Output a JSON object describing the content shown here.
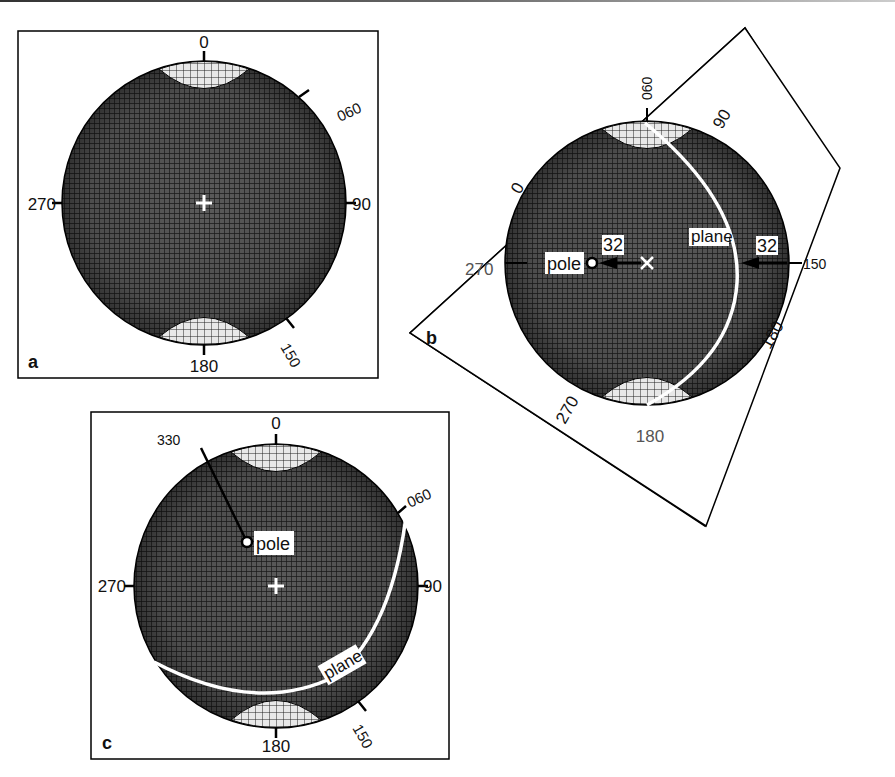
{
  "figure": {
    "panels": [
      {
        "id": "a",
        "panel_label": "a",
        "labels": {
          "n": "0",
          "e": "90",
          "s": "180",
          "w": "270",
          "ne": "060",
          "se": "150"
        }
      },
      {
        "id": "b",
        "panel_label": "b",
        "rotation_deg": -30,
        "labels": {
          "top": "060",
          "upper_right": "90",
          "left_upper": "0",
          "right_lower": "180",
          "lower_left": "270",
          "bottom": "180",
          "left": "270",
          "right": "150"
        },
        "annotations": {
          "pole": "pole",
          "plane": "plane",
          "dip_left": "32",
          "dip_right": "32"
        }
      },
      {
        "id": "c",
        "panel_label": "c",
        "labels": {
          "n": "0",
          "e": "90",
          "s": "180",
          "w": "270",
          "ne": "060",
          "se": "150",
          "pole_azimuth": "330"
        },
        "annotations": {
          "pole": "pole",
          "plane": "plane"
        }
      }
    ]
  }
}
